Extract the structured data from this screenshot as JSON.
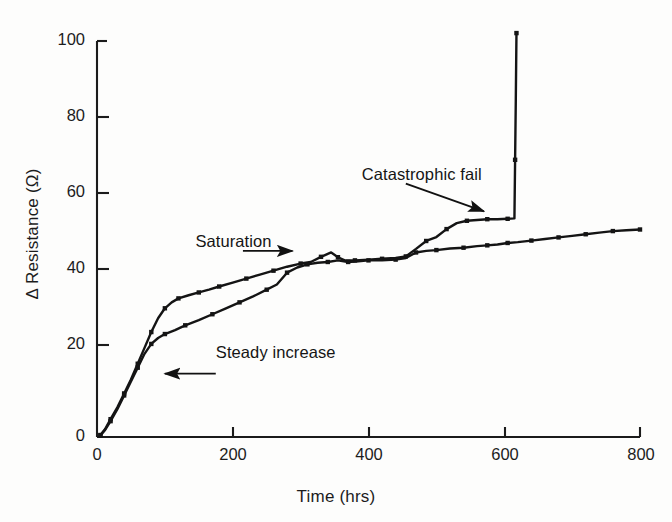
{
  "chart_data": {
    "type": "line",
    "title": "",
    "subtitle": "",
    "xlabel": "Time (hrs)",
    "ylabel": "Δ Resistance (Ω)",
    "xlim": [
      0,
      800
    ],
    "ylim": [
      0,
      100
    ],
    "xticks": [
      0,
      200,
      400,
      600,
      800
    ],
    "yticks": [
      0,
      20,
      40,
      60,
      80,
      100
    ],
    "xtick_labels": [
      "0",
      "200",
      "400",
      "600",
      "800"
    ],
    "ytick_labels": [
      "0",
      "20",
      "40",
      "60",
      "80",
      "100"
    ],
    "grid": false,
    "legend": null,
    "legend_position": "none",
    "marker": "filled-square",
    "line_color": "#141414",
    "series": [
      {
        "name": "Sample A (catastrophic fail)",
        "marker": "filled-square",
        "color": "#141414",
        "points": [
          [
            5,
            0.5
          ],
          [
            12,
            2.0
          ],
          [
            20,
            4.5
          ],
          [
            30,
            7.5
          ],
          [
            40,
            11.0
          ],
          [
            50,
            14.5
          ],
          [
            60,
            18.5
          ],
          [
            70,
            22.5
          ],
          [
            80,
            26.5
          ],
          [
            90,
            30.0
          ],
          [
            100,
            32.5
          ],
          [
            110,
            34.0
          ],
          [
            120,
            35.0
          ],
          [
            135,
            35.8
          ],
          [
            150,
            36.5
          ],
          [
            165,
            37.2
          ],
          [
            180,
            38.0
          ],
          [
            200,
            39.0
          ],
          [
            220,
            40.0
          ],
          [
            240,
            41.0
          ],
          [
            260,
            42.0
          ],
          [
            280,
            43.0
          ],
          [
            300,
            43.8
          ],
          [
            315,
            44.2
          ],
          [
            330,
            45.5
          ],
          [
            345,
            46.6
          ],
          [
            355,
            45.4
          ],
          [
            365,
            44.6
          ],
          [
            380,
            44.6
          ],
          [
            400,
            44.8
          ],
          [
            420,
            45.0
          ],
          [
            440,
            45.2
          ],
          [
            455,
            45.6
          ],
          [
            470,
            47.5
          ],
          [
            485,
            49.5
          ],
          [
            500,
            50.5
          ],
          [
            515,
            52.5
          ],
          [
            530,
            54.0
          ],
          [
            545,
            54.6
          ],
          [
            560,
            54.8
          ],
          [
            575,
            55.0
          ],
          [
            590,
            55.0
          ],
          [
            605,
            55.1
          ],
          [
            615,
            55.2
          ],
          [
            616,
            70.0
          ],
          [
            617,
            85.0
          ],
          [
            618,
            102.0
          ]
        ]
      },
      {
        "name": "Sample B (survives)",
        "marker": "filled-square",
        "color": "#141414",
        "points": [
          [
            5,
            0.4
          ],
          [
            12,
            1.8
          ],
          [
            20,
            4.0
          ],
          [
            30,
            7.0
          ],
          [
            40,
            10.5
          ],
          [
            50,
            14.0
          ],
          [
            60,
            17.5
          ],
          [
            70,
            21.0
          ],
          [
            80,
            23.5
          ],
          [
            90,
            25.0
          ],
          [
            100,
            26.0
          ],
          [
            115,
            27.0
          ],
          [
            130,
            28.2
          ],
          [
            150,
            29.5
          ],
          [
            170,
            31.0
          ],
          [
            190,
            32.5
          ],
          [
            210,
            34.0
          ],
          [
            230,
            35.5
          ],
          [
            250,
            37.2
          ],
          [
            265,
            38.5
          ],
          [
            280,
            41.5
          ],
          [
            295,
            42.8
          ],
          [
            310,
            43.6
          ],
          [
            325,
            44.0
          ],
          [
            340,
            44.2
          ],
          [
            355,
            44.6
          ],
          [
            370,
            44.2
          ],
          [
            385,
            44.4
          ],
          [
            400,
            44.6
          ],
          [
            420,
            44.6
          ],
          [
            440,
            44.8
          ],
          [
            455,
            45.2
          ],
          [
            470,
            46.6
          ],
          [
            485,
            47.0
          ],
          [
            500,
            47.2
          ],
          [
            520,
            47.6
          ],
          [
            540,
            47.8
          ],
          [
            560,
            48.2
          ],
          [
            575,
            48.4
          ],
          [
            590,
            48.6
          ],
          [
            605,
            49.0
          ],
          [
            620,
            49.2
          ],
          [
            640,
            49.6
          ],
          [
            660,
            50.0
          ],
          [
            680,
            50.4
          ],
          [
            700,
            50.8
          ],
          [
            720,
            51.2
          ],
          [
            740,
            51.6
          ],
          [
            760,
            52.0
          ],
          [
            780,
            52.2
          ],
          [
            800,
            52.4
          ]
        ]
      }
    ],
    "annotations": [
      {
        "id": "catastrophic-fail",
        "text": "Catastrophic fail",
        "text_x": 390,
        "text_y": 66,
        "arrow_from": [
          455,
          64
        ],
        "arrow_to": [
          570,
          57
        ],
        "arrow_direction": "down-right"
      },
      {
        "id": "saturation",
        "text": "Saturation",
        "text_x": 145,
        "text_y": 49,
        "arrow_from": [
          215,
          47
        ],
        "arrow_to": [
          288,
          47
        ],
        "arrow_direction": "right"
      },
      {
        "id": "steady-increase",
        "text": "Steady increase",
        "text_x": 175,
        "text_y": 21,
        "arrow_from": [
          175,
          16
        ],
        "arrow_to": [
          100,
          16
        ],
        "arrow_direction": "left"
      }
    ]
  },
  "axis": {
    "x_title": "Time (hrs)",
    "y_title": "Δ Resistance (Ω)"
  }
}
